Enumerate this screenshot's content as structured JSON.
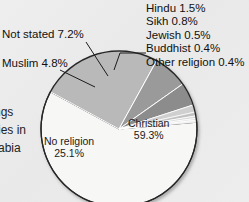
{
  "figure": {
    "background_color": "#ececec",
    "text_color": "#111111"
  },
  "chart_data": {
    "type": "pie",
    "title": "",
    "subtitle": "",
    "xlabel": "",
    "ylabel": "",
    "units": "percent",
    "total": 100.0,
    "legend_position": "callout-labels",
    "grid": false,
    "start_angle_deg": -5,
    "direction": "clockwise",
    "categories": [
      "Christian",
      "No religion",
      "Not stated",
      "Muslim",
      "Hindu",
      "Sikh",
      "Jewish",
      "Buddhist",
      "Other religion"
    ],
    "values": [
      59.3,
      25.1,
      7.2,
      4.8,
      1.5,
      0.8,
      0.5,
      0.4,
      0.4
    ],
    "slice_colors": [
      "#f7f7f5",
      "#b9b9b9",
      "#9a9a9a",
      "#8c8c8c",
      "#cfcfcf",
      "#c2c2c2",
      "#d8d8d8",
      "#e4e4e4",
      "#eeeeee"
    ],
    "slice_label_placement": [
      "inside",
      "inside",
      "callout-left",
      "callout-left",
      "callout-right",
      "callout-right",
      "callout-right",
      "callout-right",
      "callout-right"
    ],
    "slices": [
      {
        "label": "Christian",
        "value": 59.3,
        "display": "Christian 59.3%",
        "value_text": "59.3%",
        "color": "#f7f7f5"
      },
      {
        "label": "No religion",
        "value": 25.1,
        "display": "No religion 25.1%",
        "value_text": "25.1%",
        "color": "#b9b9b9"
      },
      {
        "label": "Not stated",
        "value": 7.2,
        "display": "Not stated 7.2%",
        "value_text": "7.2%",
        "color": "#9a9a9a"
      },
      {
        "label": "Muslim",
        "value": 4.8,
        "display": "Muslim 4.8%",
        "value_text": "4.8%",
        "color": "#8c8c8c"
      },
      {
        "label": "Hindu",
        "value": 1.5,
        "display": "Hindu 1.5%",
        "value_text": "1.5%",
        "color": "#cfcfcf"
      },
      {
        "label": "Sikh",
        "value": 0.8,
        "display": "Sikh 0.8%",
        "value_text": "0.8%",
        "color": "#c2c2c2"
      },
      {
        "label": "Jewish",
        "value": 0.5,
        "display": "Jewish 0.5%",
        "value_text": "0.5%",
        "color": "#d8d8d8"
      },
      {
        "label": "Buddhist",
        "value": 0.4,
        "display": "Buddhist 0.4%",
        "value_text": "0.4%",
        "color": "#e4e4e4"
      },
      {
        "label": "Other religion",
        "value": 0.4,
        "display": "Other religion 0.4%",
        "value_text": "0.4%",
        "color": "#eeeeee"
      }
    ]
  },
  "inner_labels": {
    "christian": {
      "name": "Christian",
      "percent": "59.3%"
    },
    "no_religion": {
      "name": "No religion",
      "percent": "25.1%"
    }
  },
  "left_callouts": {
    "not_stated": "Not stated 7.2%",
    "muslim": "Muslim 4.8%"
  },
  "right_callouts": [
    "Hindu 1.5%",
    "Sikh 0.8%",
    "Jewish 0.5%",
    "Buddhist 0.4%",
    "Other religion 0.4%"
  ],
  "margin_text": {
    "line1": "ngs",
    "line2": "ries in",
    "line3": "rabia"
  }
}
